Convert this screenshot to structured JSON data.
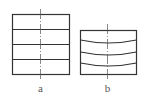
{
  "diagram": {
    "type": "technical-drawing",
    "panels": [
      {
        "id": "a",
        "label": "a",
        "description": "rectangle divided by straight horizontal lines",
        "box": {
          "x": 12,
          "y": 14,
          "w": 57,
          "h": 60
        },
        "lines": [
          {
            "y": 29,
            "sag": 0
          },
          {
            "y": 44,
            "sag": 0
          },
          {
            "y": 59,
            "sag": 0
          }
        ],
        "centerline": {
          "x": 40,
          "y1": 9,
          "y2": 81
        }
      },
      {
        "id": "b",
        "label": "b",
        "description": "rectangle divided by curved (sagging) horizontal lines",
        "box": {
          "x": 80,
          "y": 30,
          "w": 56,
          "h": 44
        },
        "lines": [
          {
            "y": 40,
            "sag": 3
          },
          {
            "y": 52,
            "sag": 3
          },
          {
            "y": 63,
            "sag": 3
          }
        ],
        "centerline": {
          "x": 107,
          "y1": 24,
          "y2": 81
        }
      }
    ],
    "colors": {
      "stroke": "#333333",
      "centerline": "#555555",
      "label": "#555555"
    }
  }
}
